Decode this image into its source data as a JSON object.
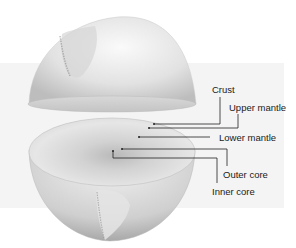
{
  "diagram": {
    "type": "cutaway",
    "labels": [
      {
        "id": "crust",
        "text": "Crust"
      },
      {
        "id": "upper-mantle",
        "text": "Upper mantle"
      },
      {
        "id": "lower-mantle",
        "text": "Lower mantle"
      },
      {
        "id": "outer-core",
        "text": "Outer core"
      },
      {
        "id": "inner-core",
        "text": "Inner core"
      }
    ]
  }
}
